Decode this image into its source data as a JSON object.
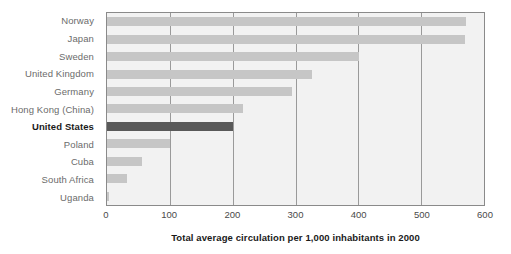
{
  "chart_data": {
    "type": "bar",
    "orientation": "horizontal",
    "title": "",
    "subtitle": "",
    "xlabel": "Total average circulation per 1,000 inhabitants in 2000",
    "ylabel": "",
    "xlim": [
      0,
      600
    ],
    "xticks": [
      0,
      100,
      200,
      300,
      400,
      500,
      600
    ],
    "xtick_labels": [
      "0",
      "100",
      "200",
      "300",
      "400",
      "500",
      "600"
    ],
    "grid": true,
    "legend": null,
    "categories": [
      "Norway",
      "Japan",
      "Sweden",
      "United Kingdom",
      "Germany",
      "Hong Kong (China)",
      "United States",
      "Poland",
      "Cuba",
      "South Africa",
      "Uganda"
    ],
    "values": [
      571,
      570,
      401,
      327,
      294,
      216,
      200,
      101,
      55,
      32,
      3
    ],
    "highlight_category": "United States",
    "colors": {
      "bar": "#c6c6c6",
      "bar_highlight": "#595959",
      "plot_background": "#f2f2f2",
      "gridline": "#9a9a9a",
      "plot_border": "#8a8a8a",
      "label": "#6b6b6b",
      "label_highlight": "#1a1a1a",
      "tick_label": "#4a4a4a",
      "axis_title": "#1a1a1a",
      "page_background": "#ffffff"
    }
  }
}
